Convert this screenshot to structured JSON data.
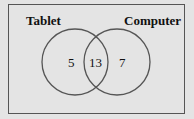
{
  "diagram": {
    "type": "venn",
    "sets": [
      {
        "label": "Tablet",
        "only_count": "5"
      },
      {
        "label": "Computer",
        "only_count": "7"
      }
    ],
    "intersection_count": "13",
    "colors": {
      "background": "#e4e4e4",
      "stroke": "#555555",
      "text": "#111111"
    }
  }
}
